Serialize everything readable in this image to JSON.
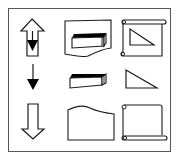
{
  "diagram": {
    "title": "",
    "frame": {
      "stroke": "#555555",
      "background": "#ffffff"
    },
    "colors": {
      "line": "#1a1a1a",
      "fill": "#000000"
    },
    "grid": {
      "rows": 3,
      "cols": 3
    },
    "cells": [
      {
        "row": 0,
        "col": 0,
        "icon": "hollow-up-arrow-with-filled-down-arrow-icon"
      },
      {
        "row": 0,
        "col": 1,
        "icon": "document-with-block-icon"
      },
      {
        "row": 0,
        "col": 2,
        "icon": "scroll-with-triangle-icon"
      },
      {
        "row": 1,
        "col": 0,
        "icon": "filled-down-arrow-icon"
      },
      {
        "row": 1,
        "col": 1,
        "icon": "block-icon"
      },
      {
        "row": 1,
        "col": 2,
        "icon": "right-triangle-icon"
      },
      {
        "row": 2,
        "col": 0,
        "icon": "hollow-down-arrow-icon"
      },
      {
        "row": 2,
        "col": 1,
        "icon": "document-icon"
      },
      {
        "row": 2,
        "col": 2,
        "icon": "scroll-icon"
      }
    ]
  }
}
